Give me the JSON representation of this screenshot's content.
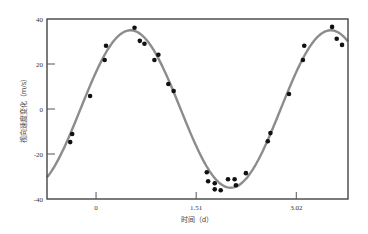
{
  "chart_data": {
    "type": "scatter",
    "title": "",
    "xlabel": "时间（d）",
    "ylabel": "视向速度变化（m/s）",
    "xlim": [
      -0.74,
      3.8
    ],
    "ylim": [
      -40,
      40
    ],
    "x_ticks": [
      0,
      1.51,
      3.02
    ],
    "x_tick_labels": [
      "0",
      "1.51",
      "3.02"
    ],
    "y_ticks": [
      -40,
      -20,
      0,
      20,
      40
    ],
    "y_tick_labels": [
      "-40",
      "-20",
      "0",
      "20",
      "40"
    ],
    "grid": false,
    "colors": {
      "points": "#111111",
      "curve": "#8c8c8c",
      "axes": "#444444"
    },
    "series": [
      {
        "name": "observations",
        "kind": "scatter",
        "x": [
          -0.39,
          -0.36,
          -0.09,
          0.13,
          0.15,
          0.58,
          0.66,
          0.73,
          0.88,
          0.94,
          1.09,
          1.17,
          1.67,
          1.69,
          1.79,
          1.79,
          1.88,
          1.99,
          2.09,
          2.11,
          2.26,
          2.59,
          2.63,
          2.91,
          3.12,
          3.14,
          3.56,
          3.63,
          3.71
        ],
        "y": [
          -14.7,
          -11.1,
          5.8,
          21.8,
          28.1,
          36.1,
          30.3,
          29.0,
          21.8,
          24.1,
          11.1,
          8.0,
          -28.1,
          -32.1,
          -33.0,
          -35.7,
          -36.1,
          -31.2,
          -31.2,
          -33.9,
          -28.5,
          -14.3,
          -10.7,
          6.7,
          21.8,
          28.1,
          36.5,
          31.2,
          28.5
        ]
      },
      {
        "name": "sinusoidal fit",
        "kind": "line",
        "amplitude": 35,
        "period": 3.02,
        "peak_x": 0.52
      }
    ]
  }
}
